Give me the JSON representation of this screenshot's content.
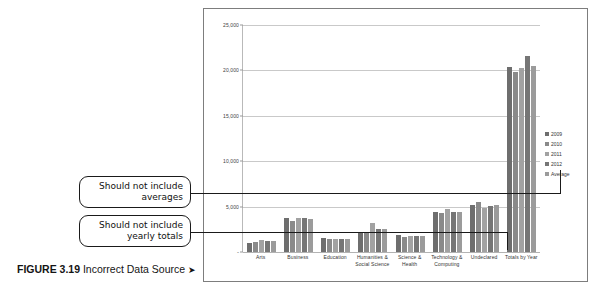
{
  "caption": {
    "figure_number": "FIGURE 3.19",
    "title": " Incorrect Data Source ",
    "arrow": "➤"
  },
  "callouts": [
    {
      "name": "averages",
      "line1": "Should not include",
      "line2": "averages"
    },
    {
      "name": "yearly-totals",
      "line1": "Should not include",
      "line2": "yearly totals"
    }
  ],
  "legend": {
    "position": "right",
    "entries": [
      {
        "label": "2009",
        "color": "#6e6e6e"
      },
      {
        "label": "2010",
        "color": "#8a8a8a"
      },
      {
        "label": "2011",
        "color": "#a2a2a2"
      },
      {
        "label": "2012",
        "color": "#767676"
      },
      {
        "label": "Average",
        "color": "#9b9b9b"
      }
    ]
  },
  "axis": {
    "y_ticks": [
      "25,000",
      "20,000",
      "15,000",
      "10,000",
      "5,000",
      "-"
    ]
  },
  "chart_data": {
    "type": "bar",
    "title": "",
    "xlabel": "",
    "ylabel": "",
    "ylim": [
      0,
      25000
    ],
    "grid": true,
    "legend_position": "right",
    "categories": [
      "Arts",
      "Business",
      "Education",
      "Humanities & Social Science",
      "Science & Health",
      "Technology & Computing",
      "Undeclared",
      "Totals by Year"
    ],
    "category_lines": [
      [
        "Arts"
      ],
      [
        "Business"
      ],
      [
        "Education"
      ],
      [
        "Humanities &",
        "Social Science"
      ],
      [
        "Science &",
        "Health"
      ],
      [
        "Technology &",
        "Computing"
      ],
      [
        "Undeclared"
      ],
      [
        "Totals by Year"
      ]
    ],
    "series": [
      {
        "name": "2009",
        "values": [
          1000,
          3750,
          1550,
          2250,
          1850,
          4450,
          5200,
          20400
        ]
      },
      {
        "name": "2010",
        "values": [
          1100,
          3400,
          1450,
          2150,
          1650,
          4250,
          5500,
          19800
        ]
      },
      {
        "name": "2011",
        "values": [
          1350,
          3800,
          1450,
          3150,
          1800,
          4700,
          4800,
          20300
        ]
      },
      {
        "name": "2012",
        "values": [
          1200,
          3700,
          1450,
          2500,
          1800,
          4400,
          5050,
          21550
        ]
      },
      {
        "name": "Average",
        "values": [
          1160,
          3660,
          1475,
          2510,
          1775,
          4450,
          5140,
          20510
        ]
      }
    ]
  }
}
